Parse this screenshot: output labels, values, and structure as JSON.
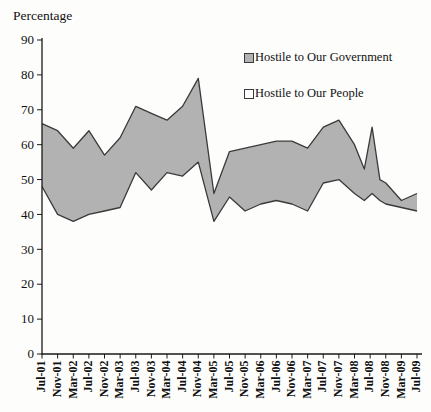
{
  "page": {
    "background": "#fdfdfc"
  },
  "chart_data": {
    "type": "area",
    "title": "",
    "ylabel": "Percentage",
    "xlabel": "",
    "ylim": [
      0,
      90
    ],
    "ytick_step": 10,
    "grid": false,
    "band_fill": "#b2b2b2",
    "line_color": "#3a3a3a",
    "axis_color": "#1a1a1a",
    "text_color": "#111111",
    "x_axis": {
      "unit": "survey date (month-year), Jul-01 = 0 months",
      "xlim_months": [
        0,
        96
      ],
      "ticks": [
        {
          "m": 0,
          "label": "Jul-01"
        },
        {
          "m": 4,
          "label": "Nov-01"
        },
        {
          "m": 8,
          "label": "Mar-02"
        },
        {
          "m": 12,
          "label": "Jul-02"
        },
        {
          "m": 16,
          "label": "Nov-02"
        },
        {
          "m": 20,
          "label": "Mar-03"
        },
        {
          "m": 24,
          "label": "Jul-03"
        },
        {
          "m": 28,
          "label": "Nov-03"
        },
        {
          "m": 32,
          "label": "Mar-04"
        },
        {
          "m": 36,
          "label": "Jul-04"
        },
        {
          "m": 40,
          "label": "Nov-04"
        },
        {
          "m": 44,
          "label": "Mar-05"
        },
        {
          "m": 48,
          "label": "Jul-05"
        },
        {
          "m": 52,
          "label": "Nov-05"
        },
        {
          "m": 56,
          "label": "Mar-06"
        },
        {
          "m": 60,
          "label": "Jul-06"
        },
        {
          "m": 64,
          "label": "Nov-06"
        },
        {
          "m": 68,
          "label": "Mar-07"
        },
        {
          "m": 72,
          "label": "Jul-07"
        },
        {
          "m": 76,
          "label": "Nov-07"
        },
        {
          "m": 80,
          "label": "Mar-08"
        },
        {
          "m": 84,
          "label": "Jul-08"
        },
        {
          "m": 88,
          "label": "Nov-08"
        },
        {
          "m": 92,
          "label": "Mar-09"
        },
        {
          "m": 96,
          "label": "Jul-09"
        }
      ]
    },
    "legend": {
      "position": "inside-top-right",
      "entries": [
        {
          "label": "Hostile to Our Government",
          "swatch": "#b2b2b2"
        },
        {
          "label": "Hostile to Our People",
          "swatch": "#ffffff"
        }
      ]
    },
    "series": [
      {
        "name": "Hostile to Our Government",
        "role": "upper-line",
        "points": [
          [
            0,
            66
          ],
          [
            4,
            64
          ],
          [
            8,
            59
          ],
          [
            12,
            64
          ],
          [
            16,
            57
          ],
          [
            20,
            62
          ],
          [
            24,
            71
          ],
          [
            28,
            69
          ],
          [
            32,
            67
          ],
          [
            36,
            71
          ],
          [
            40,
            79
          ],
          [
            44,
            46
          ],
          [
            48,
            58
          ],
          [
            52,
            59
          ],
          [
            56,
            60
          ],
          [
            60,
            61
          ],
          [
            64,
            61
          ],
          [
            68,
            59
          ],
          [
            72,
            65
          ],
          [
            76,
            67
          ],
          [
            80,
            60
          ],
          [
            82.5,
            53
          ],
          [
            84.5,
            65
          ],
          [
            86.5,
            50
          ],
          [
            88,
            49
          ],
          [
            92,
            44
          ],
          [
            96,
            46
          ]
        ]
      },
      {
        "name": "Hostile to Our People",
        "role": "lower-line",
        "points": [
          [
            0,
            48
          ],
          [
            4,
            40
          ],
          [
            8,
            38
          ],
          [
            12,
            40
          ],
          [
            16,
            41
          ],
          [
            20,
            42
          ],
          [
            24,
            52
          ],
          [
            28,
            47
          ],
          [
            32,
            52
          ],
          [
            36,
            51
          ],
          [
            40,
            55
          ],
          [
            44,
            38
          ],
          [
            48,
            45
          ],
          [
            52,
            41
          ],
          [
            56,
            43
          ],
          [
            60,
            44
          ],
          [
            64,
            43
          ],
          [
            68,
            41
          ],
          [
            72,
            49
          ],
          [
            76,
            50
          ],
          [
            80,
            46
          ],
          [
            82.5,
            44
          ],
          [
            84.5,
            46
          ],
          [
            86.5,
            44
          ],
          [
            88,
            43
          ],
          [
            92,
            42
          ],
          [
            96,
            41
          ]
        ]
      }
    ]
  }
}
